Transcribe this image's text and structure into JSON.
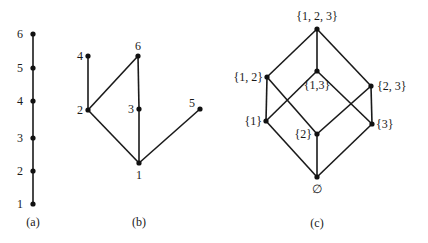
{
  "diagrams": [
    {
      "id": "a",
      "caption": "(a)",
      "caption_pos": [
        33,
        226
      ],
      "nodes": [
        {
          "id": "1",
          "label": "1",
          "x": 33,
          "y": 204,
          "lx": -10,
          "ly": 4,
          "anchor": "end"
        },
        {
          "id": "2",
          "label": "2",
          "x": 33,
          "y": 171,
          "lx": -10,
          "ly": 4,
          "anchor": "end"
        },
        {
          "id": "3",
          "label": "3",
          "x": 33,
          "y": 138,
          "lx": -10,
          "ly": 4,
          "anchor": "end"
        },
        {
          "id": "4",
          "label": "4",
          "x": 33,
          "y": 101,
          "lx": -10,
          "ly": 4,
          "anchor": "end"
        },
        {
          "id": "5",
          "label": "5",
          "x": 33,
          "y": 68,
          "lx": -10,
          "ly": 4,
          "anchor": "end"
        },
        {
          "id": "6",
          "label": "6",
          "x": 33,
          "y": 34,
          "lx": -10,
          "ly": 4,
          "anchor": "end"
        }
      ],
      "edges": [
        [
          "1",
          "2"
        ],
        [
          "2",
          "3"
        ],
        [
          "3",
          "4"
        ],
        [
          "4",
          "5"
        ],
        [
          "5",
          "6"
        ]
      ]
    },
    {
      "id": "b",
      "caption": "(b)",
      "caption_pos": [
        139,
        226
      ],
      "nodes": [
        {
          "id": "1",
          "label": "1",
          "x": 139,
          "y": 163,
          "lx": 0,
          "ly": 16,
          "anchor": "middle"
        },
        {
          "id": "2",
          "label": "2",
          "x": 88,
          "y": 110,
          "lx": -5,
          "ly": 4,
          "anchor": "end"
        },
        {
          "id": "3",
          "label": "3",
          "x": 139,
          "y": 109,
          "lx": -5,
          "ly": 4,
          "anchor": "end"
        },
        {
          "id": "4",
          "label": "4",
          "x": 88,
          "y": 56,
          "lx": -5,
          "ly": 4,
          "anchor": "end"
        },
        {
          "id": "5",
          "label": "5",
          "x": 200,
          "y": 109,
          "lx": -5,
          "ly": -2,
          "anchor": "end"
        },
        {
          "id": "6",
          "label": "6",
          "x": 138,
          "y": 56,
          "lx": 0,
          "ly": -6,
          "anchor": "middle"
        }
      ],
      "edges": [
        [
          "1",
          "2"
        ],
        [
          "1",
          "3"
        ],
        [
          "1",
          "5"
        ],
        [
          "2",
          "4"
        ],
        [
          "2",
          "6"
        ],
        [
          "3",
          "6"
        ]
      ]
    },
    {
      "id": "c",
      "caption": "(c)",
      "caption_pos": [
        317,
        227
      ],
      "nodes": [
        {
          "id": "empty",
          "label": "∅",
          "x": 317,
          "y": 177,
          "lx": 0,
          "ly": 16,
          "anchor": "middle"
        },
        {
          "id": "s1",
          "label": "{1}",
          "x": 266,
          "y": 121,
          "lx": -4,
          "ly": 4,
          "anchor": "end"
        },
        {
          "id": "s2",
          "label": "{2}",
          "x": 317,
          "y": 134,
          "lx": -5,
          "ly": 4,
          "anchor": "end"
        },
        {
          "id": "s3",
          "label": "{3}",
          "x": 372,
          "y": 124,
          "lx": 4,
          "ly": 4,
          "anchor": "start"
        },
        {
          "id": "s12",
          "label": "{1, 2}",
          "x": 267,
          "y": 77,
          "lx": -4,
          "ly": 4,
          "anchor": "end"
        },
        {
          "id": "s13",
          "label": "{1,3}",
          "x": 317,
          "y": 71,
          "lx": 0,
          "ly": 18,
          "anchor": "middle"
        },
        {
          "id": "s23",
          "label": "{2, 3}",
          "x": 371,
          "y": 86,
          "lx": 6,
          "ly": 4,
          "anchor": "start"
        },
        {
          "id": "s123",
          "label": "{1, 2, 3}",
          "x": 317,
          "y": 29,
          "lx": 0,
          "ly": -9,
          "anchor": "middle"
        }
      ],
      "edges": [
        [
          "s123",
          "s12"
        ],
        [
          "s123",
          "s13"
        ],
        [
          "s123",
          "s23"
        ],
        [
          "s12",
          "s1"
        ],
        [
          "s12",
          "s2"
        ],
        [
          "s13",
          "s1"
        ],
        [
          "s13",
          "s3"
        ],
        [
          "s23",
          "s2"
        ],
        [
          "s23",
          "s3"
        ],
        [
          "s1",
          "empty"
        ],
        [
          "s2",
          "empty"
        ],
        [
          "s3",
          "empty"
        ]
      ]
    }
  ],
  "colors": {
    "ink": "#111111",
    "background": "#ffffff"
  }
}
